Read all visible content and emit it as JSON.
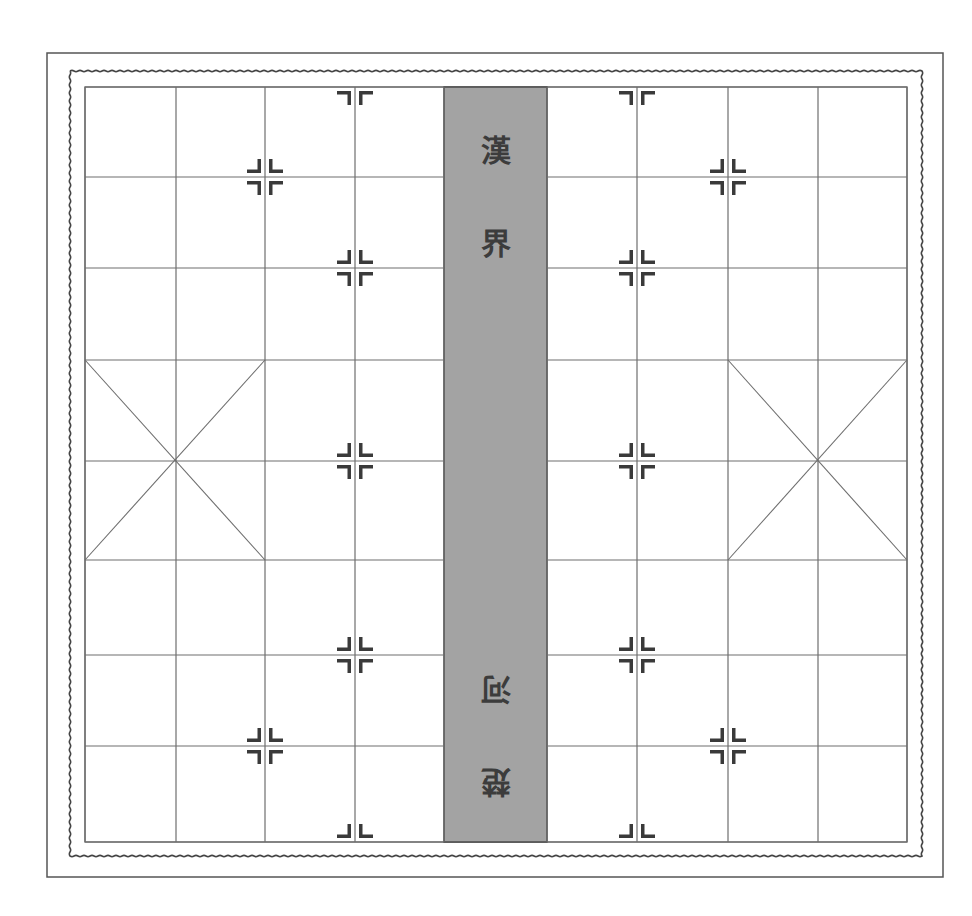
{
  "board": {
    "title": "Xiangqi (Chinese Chess) Board",
    "colors": {
      "background": "#ffffff",
      "line": "#6e6e6e",
      "border": "#555555",
      "wavy_border": "#444444",
      "river_fill": "#a3a3a3",
      "river_edge": "#4a4a4a",
      "marker": "#3a3a3a",
      "river_text": "#3c3c3c"
    },
    "frame": {
      "outer": {
        "x": 47,
        "y": 53,
        "w": 896,
        "h": 824
      },
      "wavy": {
        "x": 70,
        "y": 71,
        "w": 852,
        "h": 785
      },
      "inner": {
        "x": 85,
        "y": 87,
        "w": 822,
        "h": 755
      }
    },
    "columns_left": [
      85,
      176,
      265,
      355,
      444
    ],
    "columns_right": [
      547,
      637,
      728,
      818,
      907
    ],
    "rows": [
      87,
      177,
      268,
      360,
      461,
      560,
      655,
      746,
      842
    ],
    "river": {
      "x": 444,
      "y": 87,
      "w": 103,
      "h": 755
    },
    "river_text": {
      "upper": [
        "漢",
        "界"
      ],
      "lower": [
        "河",
        "楚"
      ],
      "upper_positions": [
        {
          "x": 496,
          "y": 150
        },
        {
          "x": 496,
          "y": 243
        }
      ],
      "lower_positions": [
        {
          "x": 496,
          "y": 689
        },
        {
          "x": 496,
          "y": 782
        }
      ],
      "lower_rotated": true
    },
    "palaces": [
      {
        "name": "left-palace",
        "x1": 85,
        "x2": 265,
        "y1": 360,
        "y2": 560,
        "cx": 176,
        "cy": 461
      },
      {
        "name": "right-palace",
        "x1": 728,
        "x2": 907,
        "y1": 360,
        "y2": 560,
        "cx": 818,
        "cy": 461
      }
    ],
    "markers": [
      {
        "x": 265,
        "y": 177,
        "type": "full"
      },
      {
        "x": 355,
        "y": 268,
        "type": "full"
      },
      {
        "x": 355,
        "y": 461,
        "type": "full"
      },
      {
        "x": 355,
        "y": 655,
        "type": "full"
      },
      {
        "x": 265,
        "y": 746,
        "type": "full"
      },
      {
        "x": 355,
        "y": 87,
        "type": "top-edge"
      },
      {
        "x": 355,
        "y": 842,
        "type": "bottom-edge"
      },
      {
        "x": 728,
        "y": 177,
        "type": "full"
      },
      {
        "x": 637,
        "y": 268,
        "type": "full"
      },
      {
        "x": 637,
        "y": 461,
        "type": "full"
      },
      {
        "x": 637,
        "y": 655,
        "type": "full"
      },
      {
        "x": 728,
        "y": 746,
        "type": "full"
      },
      {
        "x": 637,
        "y": 87,
        "type": "top-edge"
      },
      {
        "x": 637,
        "y": 842,
        "type": "bottom-edge"
      }
    ]
  }
}
